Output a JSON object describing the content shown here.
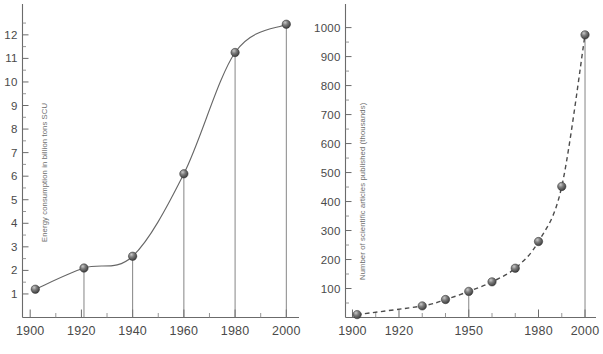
{
  "figure": {
    "background_color": "#ffffff",
    "line_color": "#666666",
    "marker_color": "#5a5a5a",
    "text_color": "#4a4a4a",
    "footer_text": ""
  },
  "chart_data": [
    {
      "id": "energy-consumption",
      "type": "line",
      "title": "",
      "subtitle": "",
      "xlabel": "",
      "ylabel": "Energy consumption in billion tons SCU",
      "xlim": [
        1897,
        2003
      ],
      "ylim": [
        0,
        12.8
      ],
      "grid": false,
      "legend": "none",
      "line_style": "solid",
      "markers": "sphere",
      "drop_lines": true,
      "x_major_ticks": [
        1900,
        1920,
        1940,
        1960,
        1980,
        2000
      ],
      "x_tick_labels": [
        "1900",
        "1920",
        "1940",
        "1960",
        "1980",
        "2000"
      ],
      "x_minor_ticks": [
        1910,
        1930,
        1950,
        1970,
        1990
      ],
      "y_major_ticks": [
        1,
        2,
        3,
        4,
        5,
        6,
        7,
        8,
        9,
        10,
        11,
        12
      ],
      "y_tick_labels": [
        "1",
        "2",
        "3",
        "4",
        "5",
        "6",
        "7",
        "8",
        "9",
        "10",
        "11",
        "12"
      ],
      "y_minor_ticks": [
        1.5,
        2.5,
        3.5,
        4.5,
        5.5,
        6.5,
        7.5,
        8.5,
        9.5,
        10.5,
        11.5,
        12.5
      ],
      "x": [
        1902,
        1921,
        1940,
        1960,
        1980,
        2000
      ],
      "values": [
        1.2,
        2.1,
        2.6,
        6.1,
        11.25,
        12.45
      ],
      "points": [
        {
          "x": 1902,
          "y": 1.2
        },
        {
          "x": 1921,
          "y": 2.1
        },
        {
          "x": 1940,
          "y": 2.6
        },
        {
          "x": 1960,
          "y": 6.1
        },
        {
          "x": 1980,
          "y": 11.25
        },
        {
          "x": 2000,
          "y": 12.45
        }
      ]
    },
    {
      "id": "scientific-articles",
      "type": "line",
      "title": "",
      "subtitle": "",
      "xlabel": "",
      "ylabel": "Number of scientific articles published (thousands)",
      "xlim": [
        1897,
        2003
      ],
      "ylim": [
        0,
        1040
      ],
      "grid": false,
      "legend": "none",
      "line_style": "dashed",
      "markers": "sphere",
      "drop_lines": true,
      "x_major_ticks": [
        1900,
        1920,
        1950,
        1980,
        2000
      ],
      "x_tick_labels": [
        "1900",
        "1920",
        "1950",
        "1980",
        "2000"
      ],
      "x_minor_ticks": [
        1910,
        1930,
        1940,
        1960,
        1970,
        1990
      ],
      "y_major_ticks": [
        100,
        200,
        300,
        400,
        500,
        600,
        700,
        800,
        900,
        1000
      ],
      "y_tick_labels": [
        "100",
        "200",
        "300",
        "400",
        "500",
        "600",
        "700",
        "800",
        "900",
        "1000"
      ],
      "y_minor_ticks": [
        50,
        150,
        250,
        350,
        450,
        550,
        650,
        750,
        850,
        950
      ],
      "x": [
        1902,
        1930,
        1940,
        1950,
        1960,
        1970,
        1980,
        1990,
        2000
      ],
      "values": [
        10,
        40,
        62,
        90,
        123,
        170,
        262,
        452,
        975
      ],
      "points": [
        {
          "x": 1902,
          "y": 10
        },
        {
          "x": 1930,
          "y": 40
        },
        {
          "x": 1940,
          "y": 62
        },
        {
          "x": 1950,
          "y": 90
        },
        {
          "x": 1960,
          "y": 123
        },
        {
          "x": 1970,
          "y": 170
        },
        {
          "x": 1980,
          "y": 262
        },
        {
          "x": 1990,
          "y": 452
        },
        {
          "x": 2000,
          "y": 975
        }
      ]
    }
  ]
}
